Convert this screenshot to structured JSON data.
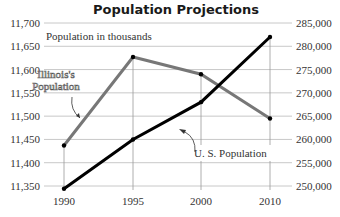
{
  "chart_data": {
    "type": "line",
    "title": "Population Projections",
    "subtitle": "Population in thousands",
    "xlabel": "",
    "categories": [
      "1990",
      "1995",
      "2000",
      "2010"
    ],
    "left_axis": {
      "label": "Illinois's Population",
      "ticks": [
        "11,350",
        "11,400",
        "11,450",
        "11,500",
        "11,550",
        "11,600",
        "11,650",
        "11,700"
      ],
      "ylim": [
        11350,
        11700
      ]
    },
    "right_axis": {
      "label": "U. S. Population",
      "ticks": [
        "250,000",
        "255,000",
        "260,000",
        "265,000",
        "270,000",
        "275,000",
        "280,000",
        "285,000"
      ],
      "ylim": [
        250000,
        285000
      ]
    },
    "series": [
      {
        "name": "Illinois's Population",
        "axis": "left",
        "color": "#777777",
        "values": [
          11437,
          11627,
          11590,
          11495
        ]
      },
      {
        "name": "U. S. Population",
        "axis": "right",
        "color": "#000000",
        "values": [
          249400,
          260000,
          268000,
          282000
        ]
      }
    ],
    "grid": true,
    "legend": "inline annotations"
  }
}
